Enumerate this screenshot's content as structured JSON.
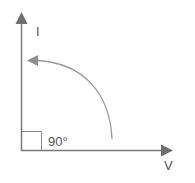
{
  "diagram": {
    "type": "phasor",
    "y_axis_label": "I",
    "x_axis_label": "V",
    "angle_label": "90°",
    "colors": {
      "axis": "#7a7a7a",
      "arc": "#9a9a9a",
      "box": "#8a8a8a",
      "text": "#555555"
    }
  }
}
